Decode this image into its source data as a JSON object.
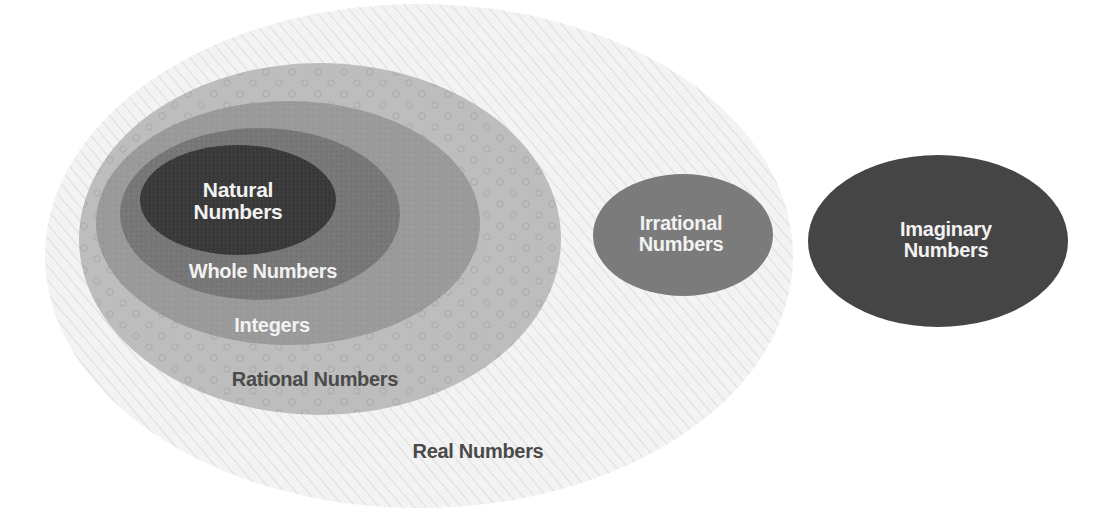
{
  "diagram": {
    "sets": {
      "real": {
        "label": "Real Numbers",
        "fill": "#f1f1f1",
        "pattern": "diagonal-hatch",
        "ellipse": {
          "cx": 419,
          "cy": 256,
          "rx": 374,
          "ry": 252
        }
      },
      "rational": {
        "label": "Rational Numbers",
        "fill": "#bdbdbd",
        "pattern": "small-circles",
        "ellipse": {
          "cx": 320,
          "cy": 239,
          "rx": 241,
          "ry": 176
        }
      },
      "integers": {
        "label": "Integers",
        "fill": "#9a9a9a",
        "ellipse": {
          "cx": 288,
          "cy": 223,
          "rx": 192,
          "ry": 122
        }
      },
      "whole": {
        "label": "Whole Numbers",
        "fill": "#777777",
        "ellipse": {
          "cx": 260,
          "cy": 214,
          "rx": 140,
          "ry": 86
        }
      },
      "natural": {
        "label_line1": "Natural",
        "label_line2": "Numbers",
        "fill": "#3a3a3a",
        "ellipse": {
          "cx": 238,
          "cy": 200,
          "rx": 98,
          "ry": 55
        }
      },
      "irrational": {
        "label_line1": "Irrational",
        "label_line2": "Numbers",
        "fill": "#7b7b7b",
        "ellipse": {
          "cx": 683,
          "cy": 235,
          "rx": 90,
          "ry": 61
        }
      },
      "imaginary": {
        "label_line1": "Imaginary",
        "label_line2": "Numbers",
        "fill": "#454545",
        "ellipse": {
          "cx": 938,
          "cy": 241,
          "rx": 130,
          "ry": 86
        }
      }
    }
  }
}
